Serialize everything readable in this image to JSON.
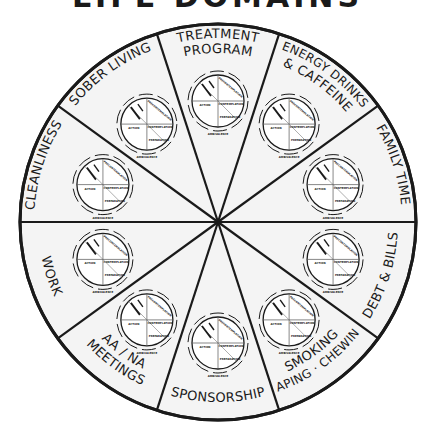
{
  "title": "LIFE DOMAINS",
  "colors": {
    "background": "#ffffff",
    "segment_fill": "#f4f4f4",
    "line": "#1a1a1a",
    "mini_wheel_fill": "#ffffff"
  },
  "wheel": {
    "center": [
      218,
      222
    ],
    "radius": 198,
    "segment_count": 10,
    "segments": [
      {
        "id": "treatment-program",
        "lines": [
          "TREATMENT",
          "PROGRAM"
        ],
        "bisector_deg": 90
      },
      {
        "id": "energy-drinks-caffeine",
        "lines": [
          "ENERGY DRINKS",
          "& CAFFEINE"
        ],
        "bisector_deg": 54
      },
      {
        "id": "family-time",
        "lines": [
          "FAMILY TIME"
        ],
        "bisector_deg": 18
      },
      {
        "id": "debt-bills",
        "lines": [
          "DEBT & BILLS"
        ],
        "bisector_deg": -18
      },
      {
        "id": "smoking-vaping-chewing",
        "lines": [
          "SMOKING",
          "VAPING · CHEWING"
        ],
        "bisector_deg": -54
      },
      {
        "id": "sponsorship",
        "lines": [
          "SPONSORSHIP"
        ],
        "bisector_deg": -90
      },
      {
        "id": "aa-na-meetings",
        "lines": [
          "AA / NA",
          "MEETINGS"
        ],
        "bisector_deg": -126
      },
      {
        "id": "work",
        "lines": [
          "WORK"
        ],
        "bisector_deg": -162
      },
      {
        "id": "cleanliness",
        "lines": [
          "CLEANLINESS"
        ],
        "bisector_deg": 162
      },
      {
        "id": "sober-living",
        "lines": [
          "SOBER LIVING"
        ],
        "bisector_deg": 126
      }
    ]
  },
  "mini_wheel": {
    "distance_from_center": 121,
    "radius": 26,
    "quadrant_labels": {
      "top_right": "PRECONTEMPLATION",
      "right": "CONTEMPLATION",
      "bottom_right": "PREPARATION",
      "left": "ACTION",
      "top_left_a": "MAINTENANCE",
      "top_left_b": "RELAPSE"
    },
    "ring_labels": {
      "bottom": "AMBIVALENCE",
      "top_right": "AMBIVALENCE",
      "top_left": "DETERMINATION"
    }
  }
}
